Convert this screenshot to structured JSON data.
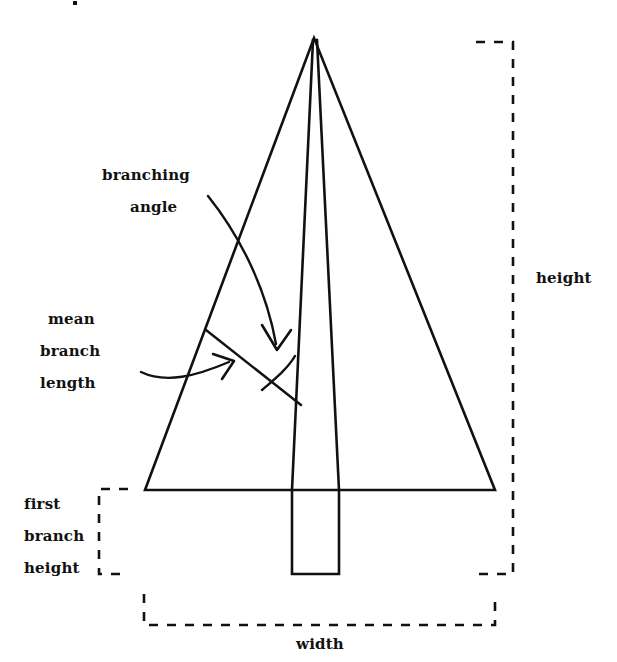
{
  "figure": {
    "background": "#ffffff",
    "ink": "#111111",
    "width": 617,
    "height": 662
  },
  "labels": {
    "branching_angle_line1": "branching",
    "branching_angle_line2": "angle",
    "mean_branch_line1": "mean",
    "mean_branch_line2": "branch",
    "mean_branch_line3": "length",
    "first_branch_line1": "first",
    "first_branch_line2": "branch",
    "first_branch_line3": "height",
    "height": "height",
    "width": "width"
  },
  "diagram_parts": {
    "crown_name": "crown-triangle",
    "trunk_name": "trunk-taper",
    "branch_name": "mean-branch-segment",
    "angle_arc_name": "branching-angle-arc",
    "height_bracket_name": "height-dimension-bracket",
    "width_bracket_name": "width-dimension-bracket",
    "first_branch_bracket_name": "first-branch-height-bracket"
  }
}
